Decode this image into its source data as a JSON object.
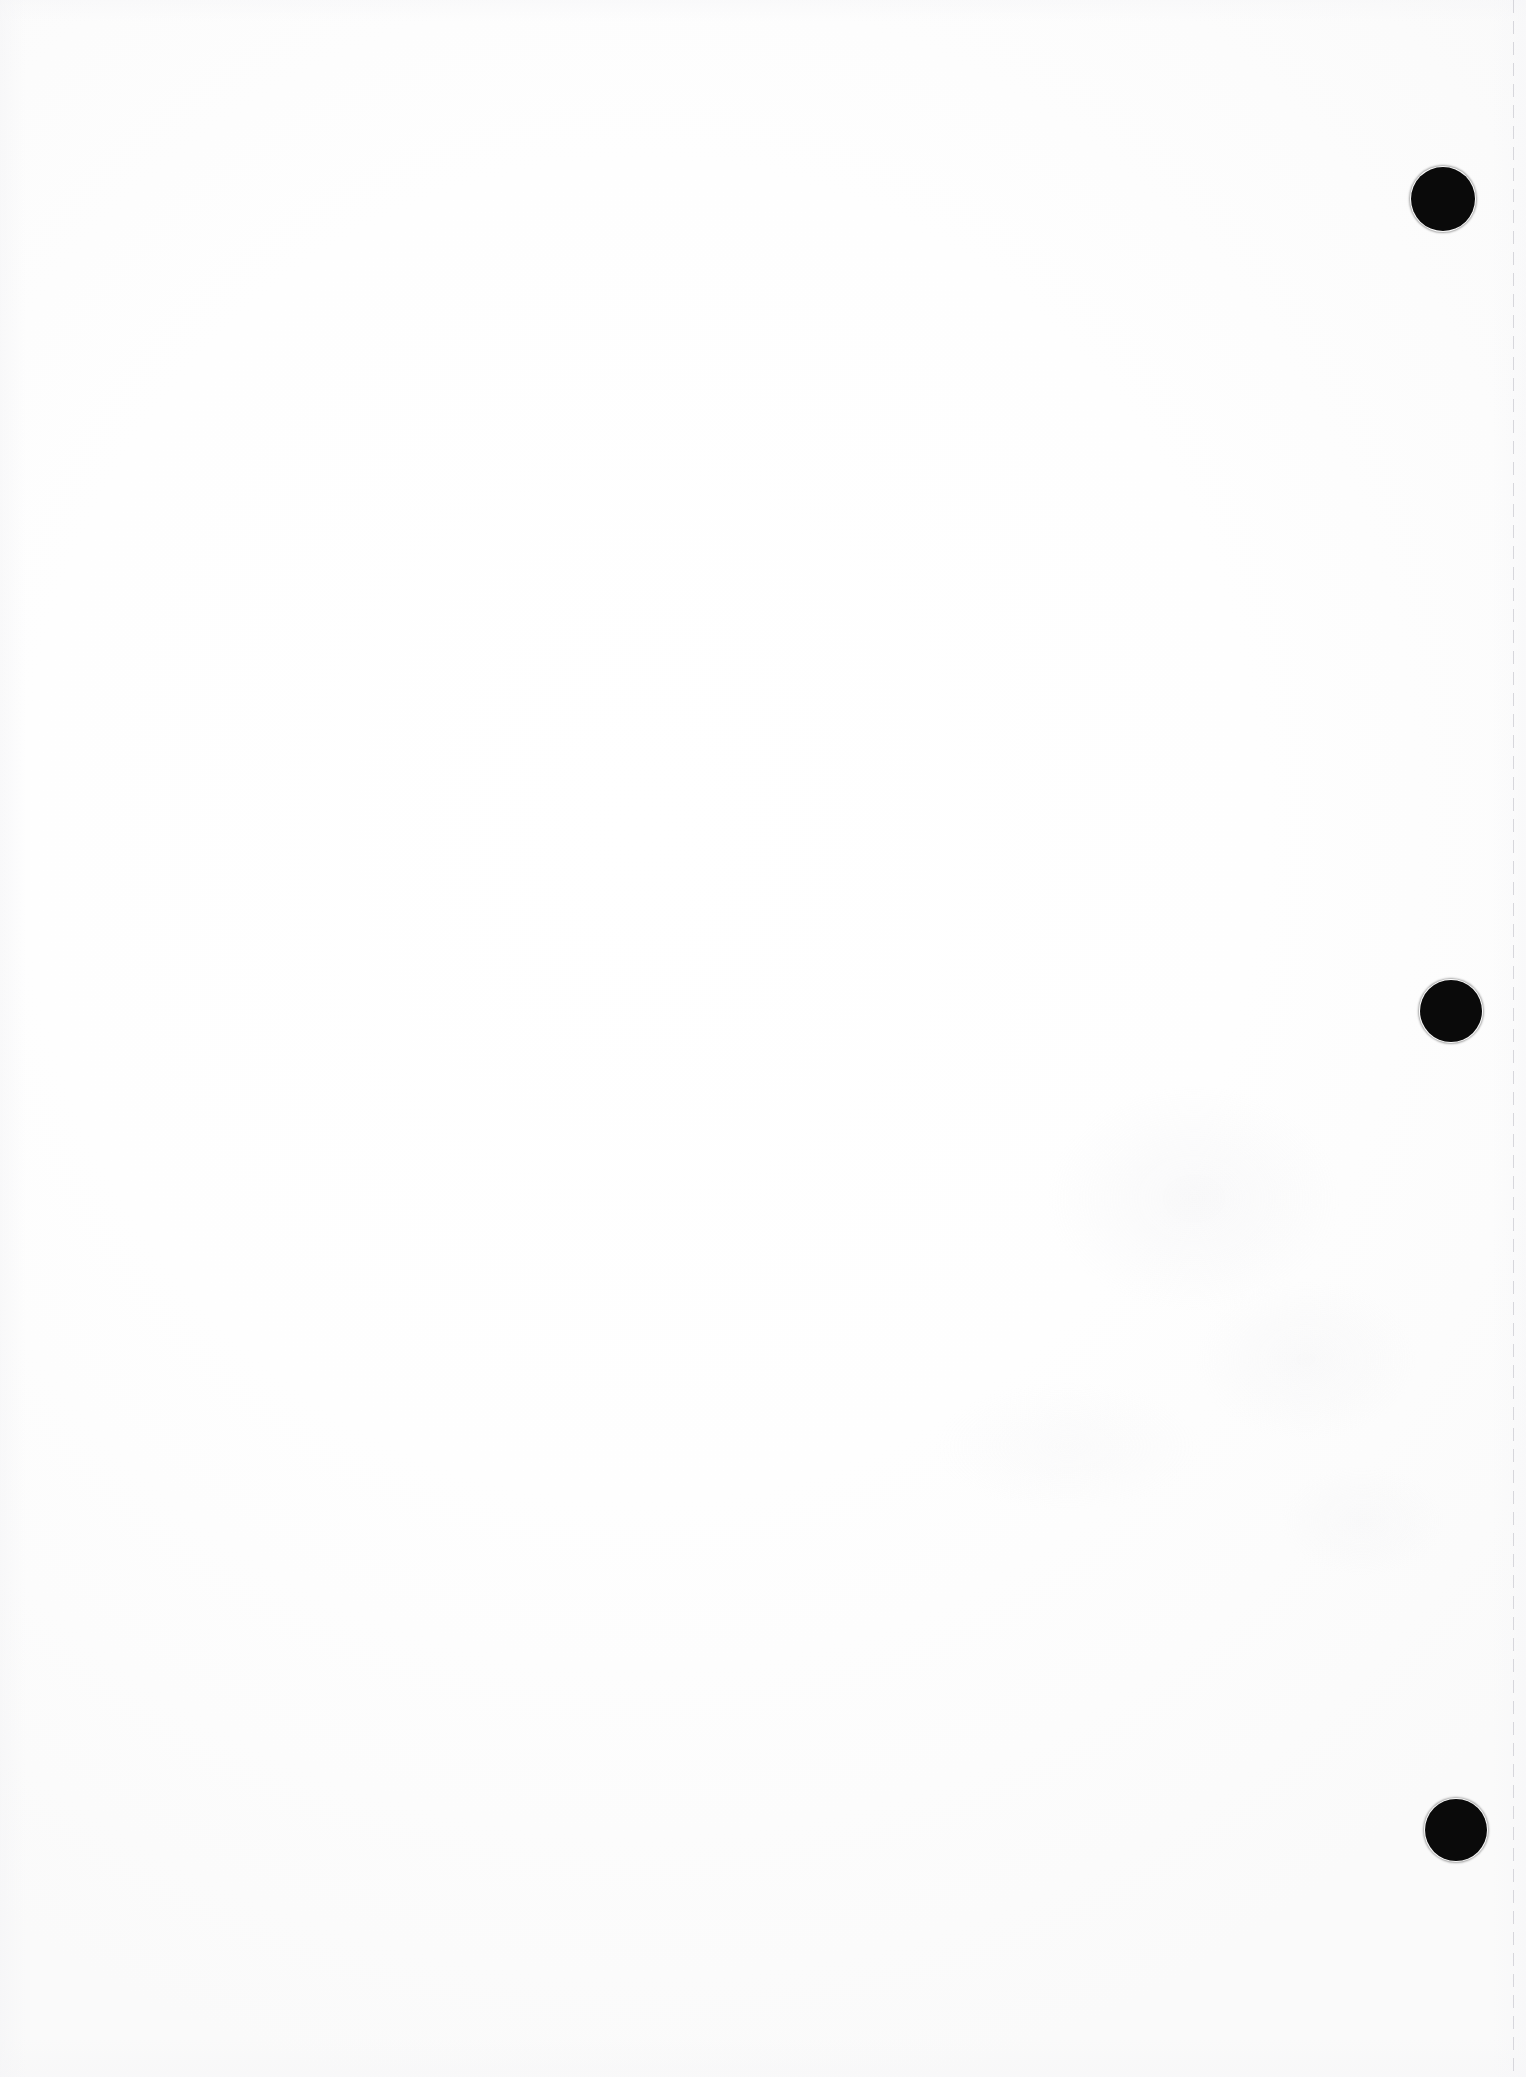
{
  "document": {
    "kind": "scanned-page",
    "page_label": "",
    "body_text": "",
    "notes": "blank scanned sheet"
  },
  "canvas": {
    "width": 1526,
    "height": 2077,
    "background_color": "#fdfdfd",
    "paper_color": "#ffffff",
    "ink_color": "#0a0a0a",
    "edge_line_color": "#d0d0d6"
  },
  "binder_holes": {
    "name": "three-ring-punch-holes",
    "count": 3,
    "color": "#0a0a0a",
    "items": [
      {
        "id": "punch-hole-top",
        "cx": 1443,
        "cy": 199,
        "r": 32
      },
      {
        "id": "punch-hole-middle",
        "cx": 1451,
        "cy": 1011,
        "r": 31
      },
      {
        "id": "punch-hole-bottom",
        "cx": 1456,
        "cy": 1830,
        "r": 31
      }
    ]
  },
  "scan_edge_line": {
    "name": "scan-edge-line",
    "x": 1513,
    "y": 0,
    "height": 2077,
    "color": "#d0d0d6",
    "style": "dashed"
  },
  "bleed_through": {
    "name": "reverse-side-bleed-through",
    "x": 760,
    "y": 1000,
    "width": 700,
    "height": 620
  }
}
